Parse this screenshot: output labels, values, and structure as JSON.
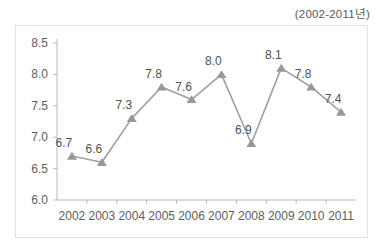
{
  "annotation": {
    "period_note": "(2002-2011년)"
  },
  "chart_data": {
    "type": "line",
    "title": "",
    "subtitle": "",
    "annotations": [
      "(2002-2011년)"
    ],
    "xlabel": "",
    "ylabel": "",
    "categories": [
      "2002",
      "2003",
      "2004",
      "2005",
      "2006",
      "2007",
      "2008",
      "2009",
      "2010",
      "2011"
    ],
    "values": [
      6.7,
      6.6,
      7.3,
      7.8,
      7.6,
      8.0,
      6.9,
      8.1,
      7.8,
      7.4
    ],
    "value_labels": [
      "6.7",
      "6.6",
      "7.3",
      "7.8",
      "7.6",
      "8.0",
      "6.9",
      "8.1",
      "7.8",
      "7.4"
    ],
    "ylim": [
      6.0,
      8.5
    ],
    "ytick_step": 0.5,
    "ytick_labels": [
      "8.5",
      "8.0",
      "7.5",
      "7.0",
      "6.5",
      "6.0"
    ],
    "ytick_values": [
      8.5,
      8.0,
      7.5,
      7.0,
      6.5,
      6.0
    ],
    "grid": false,
    "legend": "none",
    "marker": "triangle",
    "series_color": "#9d9d9d",
    "marker_color": "#989898",
    "axis_color": "#b9b9b9",
    "text_color": "#5b6064",
    "frame_color": "#e2e2e2",
    "background": "#ffffff"
  }
}
